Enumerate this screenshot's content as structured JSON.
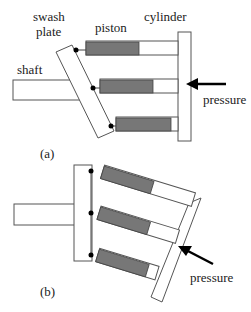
{
  "diagram": {
    "panel_a": {
      "caption": "(a)",
      "labels": {
        "swash_plate_line1": "swash",
        "swash_plate_line2": "plate",
        "piston": "piston",
        "cylinder": "cylinder",
        "shaft": "shaft",
        "pressure": "pressure"
      }
    },
    "panel_b": {
      "caption": "(b)",
      "labels": {
        "pressure": "pressure"
      }
    },
    "colors": {
      "piston_fill": "#777777",
      "outline": "#555555",
      "arrow": "#000000"
    }
  }
}
